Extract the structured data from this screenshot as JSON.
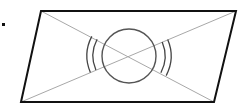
{
  "diagram": {
    "type": "geometry",
    "colors": {
      "outline": "#111111",
      "diagonal": "#a8a8a8",
      "circle": "#555555",
      "arc": "#444444",
      "dot": "#111111",
      "background": "#ffffff"
    },
    "parallelogram": {
      "vertices": [
        [
          41,
          11
        ],
        [
          236,
          11
        ],
        [
          214,
          102
        ],
        [
          21,
          102
        ]
      ]
    },
    "diagonals": [
      {
        "from": [
          41,
          11
        ],
        "to": [
          214,
          102
        ]
      },
      {
        "from": [
          21,
          102
        ],
        "to": [
          236,
          11
        ]
      }
    ],
    "center": [
      129,
      56
    ],
    "circle_radius": 27,
    "angle_marks": {
      "count_per_angle": 2,
      "radii": [
        36,
        42
      ],
      "sides": [
        "left",
        "right"
      ]
    },
    "dot": {
      "position": [
        4,
        25
      ]
    }
  }
}
